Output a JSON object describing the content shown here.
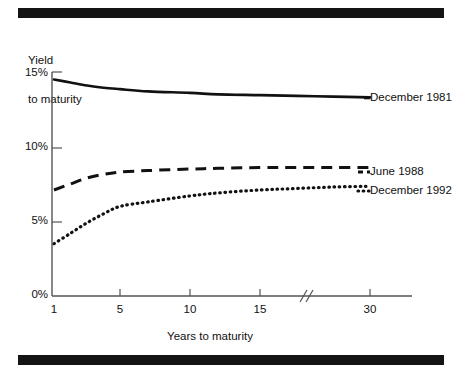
{
  "figure": {
    "background_color": "#ffffff",
    "ink_color": "#111111",
    "rule_bar_color": "#141414",
    "rules": [
      {
        "name": "top-rule"
      },
      {
        "name": "bottom-rule"
      }
    ]
  },
  "chart_data": {
    "type": "line",
    "title": "",
    "xlabel": "Years to maturity",
    "ylabel": "Yield\nto maturity",
    "ylabel_line1": "Yield",
    "ylabel_line2": "to maturity",
    "x_tick_labels": [
      "1",
      "5",
      "10",
      "15",
      "30"
    ],
    "x_tick_values": [
      1,
      5,
      10,
      15,
      30
    ],
    "y_tick_labels": [
      "0%",
      "5%",
      "10%",
      "15%"
    ],
    "y_tick_values": [
      0,
      5,
      10,
      15
    ],
    "ylim": [
      0,
      15
    ],
    "xlim": [
      1,
      30
    ],
    "grid": false,
    "axis_break": {
      "label": "//",
      "between": [
        15,
        30
      ],
      "at_x": 22
    },
    "legend_position": "right-of-line-ends",
    "series": [
      {
        "name": "December 1981",
        "style": "solid",
        "color": "#111111",
        "x": [
          1,
          2,
          3,
          4,
          5,
          7,
          10,
          12,
          15,
          20,
          25,
          30
        ],
        "values": [
          14.5,
          14.3,
          14.1,
          13.95,
          13.85,
          13.7,
          13.6,
          13.5,
          13.45,
          13.4,
          13.35,
          13.3
        ]
      },
      {
        "name": "June 1988",
        "style": "dashed",
        "color": "#111111",
        "x": [
          1,
          2,
          3,
          4,
          5,
          7,
          10,
          12,
          15,
          20,
          25,
          30
        ],
        "values": [
          7.1,
          7.5,
          7.9,
          8.15,
          8.3,
          8.4,
          8.5,
          8.55,
          8.6,
          8.6,
          8.6,
          8.6
        ]
      },
      {
        "name": "December 1992",
        "style": "dotted",
        "color": "#111111",
        "x": [
          1,
          2,
          3,
          4,
          5,
          7,
          10,
          12,
          15,
          20,
          25,
          30
        ],
        "values": [
          3.5,
          4.2,
          4.9,
          5.5,
          6.0,
          6.3,
          6.7,
          6.9,
          7.1,
          7.2,
          7.3,
          7.35
        ]
      }
    ]
  },
  "legend": {
    "items": [
      {
        "label": "December 1981"
      },
      {
        "label": "June 1988"
      },
      {
        "label": "December 1992"
      }
    ]
  }
}
